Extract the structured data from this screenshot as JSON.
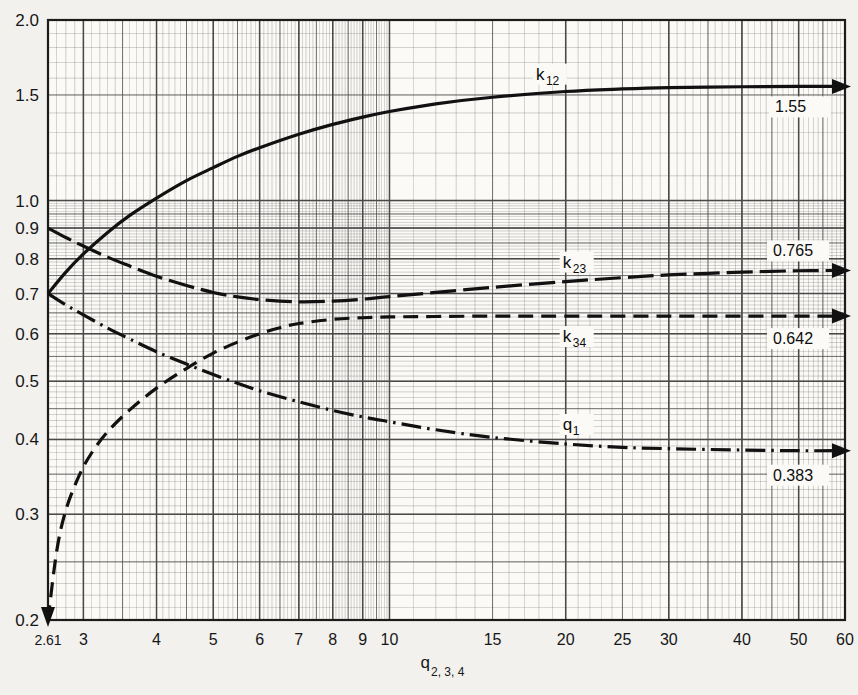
{
  "figure": {
    "background_color": "#f2f1ee",
    "paper_color": "#fbfaf7",
    "grid_color": "#4a4a4a",
    "curve_color": "#111111"
  },
  "axes": {
    "x": {
      "label_main": "q",
      "label_sub": "2, 3, 4",
      "scale": "log",
      "min": 2.61,
      "max": 60,
      "ticks": [
        2.61,
        3,
        4,
        5,
        6,
        7,
        8,
        9,
        10,
        15,
        20,
        25,
        30,
        40,
        50,
        60
      ],
      "tick_labels": [
        "2.61",
        "3",
        "4",
        "5",
        "6",
        "7",
        "8",
        "9",
        "10",
        "15",
        "20",
        "25",
        "30",
        "40",
        "50",
        "60"
      ]
    },
    "y": {
      "label": "",
      "scale": "log",
      "min": 0.2,
      "max": 2.0,
      "ticks": [
        0.2,
        0.3,
        0.4,
        0.5,
        0.6,
        0.7,
        0.8,
        0.9,
        1.0,
        1.5,
        2.0
      ],
      "tick_labels": [
        "0.2",
        "0.3",
        "0.4",
        "0.5",
        "0.6",
        "0.7",
        "0.8",
        "0.9",
        "1.0",
        "1.5",
        "2.0"
      ]
    }
  },
  "chart_data": {
    "type": "line",
    "title": "",
    "xlabel": "q_2,3,4",
    "ylabel": "",
    "xlim": [
      2.61,
      60
    ],
    "ylim": [
      0.2,
      2.0
    ],
    "xscale": "log",
    "yscale": "log",
    "grid": true,
    "legend": "inline-labels",
    "series": [
      {
        "name": "k12",
        "label": "k",
        "label_sub": "12",
        "linestyle": "solid",
        "end_value": "1.55",
        "points": [
          [
            2.61,
            0.7
          ],
          [
            2.8,
            0.76
          ],
          [
            3.0,
            0.815
          ],
          [
            3.3,
            0.885
          ],
          [
            3.6,
            0.945
          ],
          [
            4.0,
            1.01
          ],
          [
            4.5,
            1.08
          ],
          [
            5.0,
            1.135
          ],
          [
            5.5,
            1.185
          ],
          [
            6.0,
            1.225
          ],
          [
            7.0,
            1.29
          ],
          [
            8.0,
            1.34
          ],
          [
            9.0,
            1.378
          ],
          [
            10.0,
            1.408
          ],
          [
            12.0,
            1.45
          ],
          [
            15.0,
            1.487
          ],
          [
            20.0,
            1.52
          ],
          [
            25.0,
            1.535
          ],
          [
            30.0,
            1.543
          ],
          [
            40.0,
            1.548
          ],
          [
            50.0,
            1.55
          ],
          [
            60.0,
            1.55
          ]
        ]
      },
      {
        "name": "k23",
        "label": "k",
        "label_sub": "23",
        "linestyle": "long-dash",
        "end_value": "0.765",
        "points": [
          [
            2.61,
            0.9
          ],
          [
            2.8,
            0.868
          ],
          [
            3.0,
            0.84
          ],
          [
            3.3,
            0.805
          ],
          [
            3.6,
            0.778
          ],
          [
            4.0,
            0.748
          ],
          [
            4.5,
            0.722
          ],
          [
            5.0,
            0.703
          ],
          [
            5.5,
            0.691
          ],
          [
            6.0,
            0.684
          ],
          [
            7.0,
            0.678
          ],
          [
            8.0,
            0.68
          ],
          [
            9.0,
            0.685
          ],
          [
            10.0,
            0.692
          ],
          [
            12.0,
            0.703
          ],
          [
            15.0,
            0.717
          ],
          [
            20.0,
            0.733
          ],
          [
            25.0,
            0.744
          ],
          [
            30.0,
            0.752
          ],
          [
            40.0,
            0.76
          ],
          [
            50.0,
            0.764
          ],
          [
            60.0,
            0.765
          ]
        ]
      },
      {
        "name": "k34",
        "label": "k",
        "label_sub": "34",
        "linestyle": "dash",
        "end_value": "0.642",
        "points": [
          [
            2.61,
            0.2
          ],
          [
            2.7,
            0.26
          ],
          [
            2.8,
            0.305
          ],
          [
            2.95,
            0.348
          ],
          [
            3.1,
            0.38
          ],
          [
            3.3,
            0.412
          ],
          [
            3.6,
            0.448
          ],
          [
            4.0,
            0.487
          ],
          [
            4.5,
            0.525
          ],
          [
            5.0,
            0.557
          ],
          [
            5.5,
            0.581
          ],
          [
            6.0,
            0.6
          ],
          [
            6.5,
            0.614
          ],
          [
            7.0,
            0.624
          ],
          [
            8.0,
            0.634
          ],
          [
            9.0,
            0.638
          ],
          [
            10.0,
            0.64
          ],
          [
            12.0,
            0.641
          ],
          [
            15.0,
            0.642
          ],
          [
            20.0,
            0.642
          ],
          [
            30.0,
            0.642
          ],
          [
            45.0,
            0.642
          ],
          [
            60.0,
            0.642
          ]
        ]
      },
      {
        "name": "q1",
        "label": "q",
        "label_sub": "1",
        "linestyle": "dash-dot",
        "end_value": "0.383",
        "points": [
          [
            2.61,
            0.7
          ],
          [
            2.8,
            0.67
          ],
          [
            3.0,
            0.645
          ],
          [
            3.3,
            0.613
          ],
          [
            3.6,
            0.588
          ],
          [
            4.0,
            0.56
          ],
          [
            4.5,
            0.534
          ],
          [
            5.0,
            0.513
          ],
          [
            5.5,
            0.496
          ],
          [
            6.0,
            0.482
          ],
          [
            7.0,
            0.462
          ],
          [
            8.0,
            0.447
          ],
          [
            9.0,
            0.436
          ],
          [
            10.0,
            0.428
          ],
          [
            12.0,
            0.415
          ],
          [
            15.0,
            0.403
          ],
          [
            20.0,
            0.393
          ],
          [
            25.0,
            0.388
          ],
          [
            30.0,
            0.386
          ],
          [
            40.0,
            0.384
          ],
          [
            50.0,
            0.383
          ],
          [
            60.0,
            0.383
          ]
        ]
      }
    ]
  },
  "annotations": {
    "k12_label_x": 22,
    "k23_label_x": 22,
    "k34_label_x": 22,
    "q1_label_x": 22
  }
}
